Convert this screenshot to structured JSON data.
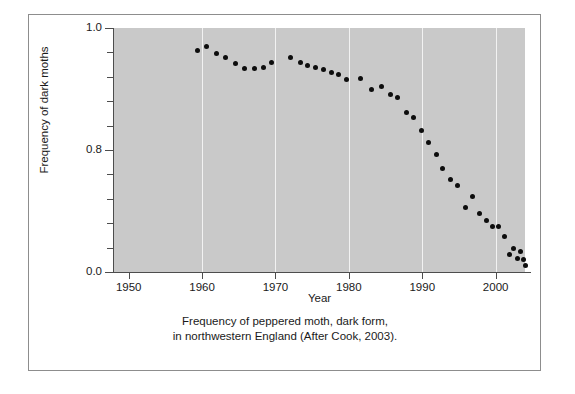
{
  "figure": {
    "background_color": "#ffffff",
    "frame_color": "#8d8d8d",
    "plot_background_color": "#c9c9c9",
    "gridline_color": "#f2f2f2",
    "point_color": "#0d0d0d",
    "axis_color": "#4d4d4d"
  },
  "caption": {
    "line1": "Frequency of peppered moth, dark form,",
    "line2": "in northwestern England (After Cook, 2003)."
  },
  "chart_data": {
    "type": "scatter",
    "title": "",
    "xlabel": "Year",
    "ylabel": "Frequency of dark moths",
    "xlim": [
      1948,
      2004
    ],
    "ylim": [
      0.0,
      1.0
    ],
    "xticks": [
      1950,
      1960,
      1970,
      1980,
      1990,
      2000
    ],
    "xtick_labels": [
      "1950",
      "1960",
      "1970",
      "1980",
      "1990",
      "2000"
    ],
    "yticks": [
      0.0,
      0.8,
      1.0
    ],
    "ytick_labels": [
      "0.0",
      "0.8",
      "1.0"
    ],
    "y_minor_tick_count": 9,
    "grid": "vertical-only",
    "legend": "none",
    "marker": "filled-circle",
    "x": [
      1959,
      1960,
      1961,
      1962,
      1963,
      1964,
      1965,
      1966,
      1967,
      1969,
      1970,
      1971,
      1972,
      1973,
      1974,
      1975,
      1976,
      1977,
      1978,
      1979,
      1980,
      1981,
      1982,
      1983,
      1984,
      1985,
      1986,
      1987,
      1988,
      1989,
      1990,
      1991,
      1992,
      1993,
      1994,
      1995,
      1996,
      1997,
      1998,
      1999,
      2000,
      2001,
      2002
    ],
    "y": [
      0.955,
      0.965,
      0.945,
      0.94,
      0.93,
      0.915,
      0.915,
      0.915,
      0.93,
      0.94,
      0.93,
      0.925,
      0.92,
      0.915,
      0.91,
      0.905,
      0.895,
      0.905,
      0.875,
      0.88,
      0.86,
      0.855,
      0.815,
      0.805,
      0.77,
      0.74,
      0.71,
      0.665,
      0.64,
      0.625,
      0.56,
      0.59,
      0.54,
      0.515,
      0.485,
      0.485,
      0.455,
      0.375,
      0.4,
      0.355,
      0.39,
      0.355,
      0.335
    ],
    "y_display_note": "plot vertical axis spans 1.0 at top to 0.0 at bottom; points read against that span"
  },
  "points_px": [
    {
      "x": 0.203,
      "y": 0.092
    },
    {
      "x": 0.226,
      "y": 0.074
    },
    {
      "x": 0.249,
      "y": 0.104
    },
    {
      "x": 0.272,
      "y": 0.121
    },
    {
      "x": 0.295,
      "y": 0.146
    },
    {
      "x": 0.318,
      "y": 0.168
    },
    {
      "x": 0.341,
      "y": 0.168
    },
    {
      "x": 0.364,
      "y": 0.162
    },
    {
      "x": 0.384,
      "y": 0.14
    },
    {
      "x": 0.43,
      "y": 0.121
    },
    {
      "x": 0.453,
      "y": 0.142
    },
    {
      "x": 0.472,
      "y": 0.152
    },
    {
      "x": 0.491,
      "y": 0.162
    },
    {
      "x": 0.51,
      "y": 0.172
    },
    {
      "x": 0.528,
      "y": 0.182
    },
    {
      "x": 0.547,
      "y": 0.192
    },
    {
      "x": 0.566,
      "y": 0.212
    },
    {
      "x": 0.6,
      "y": 0.206
    },
    {
      "x": 0.627,
      "y": 0.253
    },
    {
      "x": 0.65,
      "y": 0.241
    },
    {
      "x": 0.673,
      "y": 0.271
    },
    {
      "x": 0.69,
      "y": 0.285
    },
    {
      "x": 0.711,
      "y": 0.345
    },
    {
      "x": 0.728,
      "y": 0.365
    },
    {
      "x": 0.748,
      "y": 0.42
    },
    {
      "x": 0.766,
      "y": 0.47
    },
    {
      "x": 0.785,
      "y": 0.52
    },
    {
      "x": 0.8,
      "y": 0.575
    },
    {
      "x": 0.818,
      "y": 0.62
    },
    {
      "x": 0.836,
      "y": 0.645
    },
    {
      "x": 0.855,
      "y": 0.735
    },
    {
      "x": 0.872,
      "y": 0.69
    },
    {
      "x": 0.889,
      "y": 0.76
    },
    {
      "x": 0.906,
      "y": 0.79
    },
    {
      "x": 0.921,
      "y": 0.815
    },
    {
      "x": 0.936,
      "y": 0.815
    },
    {
      "x": 0.95,
      "y": 0.855
    },
    {
      "x": 0.962,
      "y": 0.93
    },
    {
      "x": 0.972,
      "y": 0.905
    },
    {
      "x": 0.982,
      "y": 0.945
    },
    {
      "x": 0.99,
      "y": 0.915
    },
    {
      "x": 0.996,
      "y": 0.95
    },
    {
      "x": 1.0,
      "y": 0.975
    }
  ]
}
